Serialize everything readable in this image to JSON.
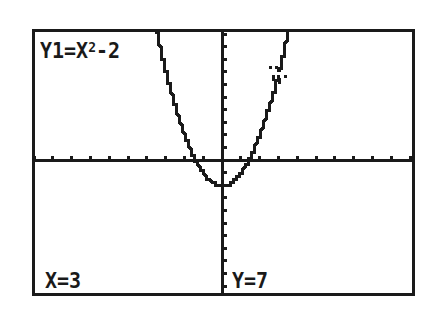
{
  "screen": {
    "equation_prefix": "Y1=X",
    "equation_exponent": "2",
    "equation_suffix": "-2",
    "x_readout": "X=3",
    "y_readout": "Y=7",
    "colors": {
      "foreground": "#1a1a1a",
      "background": "#ffffff"
    }
  },
  "chart_data": {
    "type": "line",
    "function": "y = x^2 - 2",
    "xlabel": "",
    "ylabel": "",
    "xlim": [
      -10,
      10
    ],
    "ylim": [
      -10,
      10
    ],
    "xscl": 1,
    "yscl": 1,
    "grid": false,
    "axes": true,
    "legend": "none",
    "series": [
      {
        "name": "Y1",
        "x": [
          -3.4,
          -3,
          -2,
          -1,
          0,
          1,
          2,
          3,
          3.4
        ],
        "values": [
          9.56,
          7,
          2,
          -1,
          -2,
          -1,
          2,
          7,
          9.56
        ]
      }
    ],
    "trace_cursor": {
      "x": 3,
      "y": 7
    },
    "annotations": [
      "X=3",
      "Y=7"
    ]
  }
}
